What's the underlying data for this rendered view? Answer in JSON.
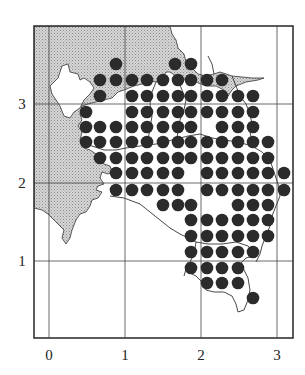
{
  "chart_data": {
    "type": "scatter",
    "title": "",
    "xlabel": "",
    "ylabel": "",
    "x_ticks": [
      "0",
      "1",
      "2",
      "3"
    ],
    "y_ticks": [
      "1",
      "2",
      "3"
    ],
    "xlim": [
      -0.2,
      3.2
    ],
    "ylim": [
      -0.1,
      3.8
    ],
    "grid": true,
    "grid_spacing": 1,
    "marker": "filled-circle",
    "dot_spacing": 0.2,
    "points_px_rows": [
      {
        "y": 64,
        "x": [
          116,
          175,
          191
        ]
      },
      {
        "y": 80,
        "x": [
          100,
          116,
          132,
          147,
          163,
          178,
          191,
          207,
          222
        ]
      },
      {
        "y": 96,
        "x": [
          100,
          132,
          147,
          163,
          178,
          191,
          207,
          222,
          238,
          253
        ]
      },
      {
        "y": 112,
        "x": [
          86,
          132,
          147,
          163,
          178,
          191,
          207,
          222,
          238,
          253
        ]
      },
      {
        "y": 127,
        "x": [
          86,
          100,
          116,
          132,
          147,
          163,
          178,
          191,
          222,
          238,
          253
        ]
      },
      {
        "y": 142,
        "x": [
          86,
          100,
          116,
          132,
          147,
          163,
          178,
          191,
          207,
          222,
          238,
          253,
          268
        ]
      },
      {
        "y": 158,
        "x": [
          100,
          116,
          132,
          147,
          163,
          178,
          191,
          207,
          222,
          238,
          253,
          268
        ]
      },
      {
        "y": 173,
        "x": [
          116,
          132,
          147,
          163,
          178,
          207,
          222,
          238,
          253,
          268,
          284
        ]
      },
      {
        "y": 190,
        "x": [
          116,
          132,
          147,
          163,
          178,
          207,
          222,
          238,
          253,
          268,
          284
        ]
      },
      {
        "y": 205,
        "x": [
          163,
          178,
          191,
          238,
          253,
          268
        ]
      },
      {
        "y": 220,
        "x": [
          191,
          207,
          222,
          238,
          253,
          268
        ]
      },
      {
        "y": 236,
        "x": [
          191,
          207,
          222,
          238,
          253,
          268
        ]
      },
      {
        "y": 252,
        "x": [
          191,
          207,
          222,
          238,
          253
        ]
      },
      {
        "y": 268,
        "x": [
          191,
          207,
          222,
          238
        ]
      },
      {
        "y": 283,
        "x": [
          207,
          222,
          238
        ]
      },
      {
        "y": 298,
        "x": [
          253
        ]
      }
    ]
  },
  "axes": {
    "x_labels": [
      {
        "text": "0",
        "px": 49
      },
      {
        "text": "1",
        "px": 125
      },
      {
        "text": "2",
        "px": 201
      },
      {
        "text": "3",
        "px": 277
      }
    ],
    "y_labels": [
      {
        "text": "3",
        "py": 104
      },
      {
        "text": "2",
        "py": 183
      },
      {
        "text": "1",
        "py": 261
      }
    ]
  },
  "colors": {
    "dot": "#2b2b2b",
    "frame": "#333333",
    "grid": "#444444",
    "shade": "#c8c8c8",
    "coast": "#333333",
    "background": "#ffffff"
  }
}
